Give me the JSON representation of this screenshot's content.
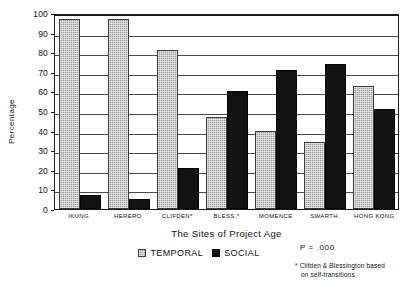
{
  "chart_data": {
    "type": "bar",
    "title": "",
    "xlabel": "The Sites of Project Age",
    "ylabel": "Percentage",
    "ylim": [
      0,
      100
    ],
    "ytick_step": 10,
    "grid": true,
    "legend_position": "bottom",
    "categories": [
      "IKUNG",
      "HERERO",
      "CLIFDEN*",
      "BLESS.*",
      "MOMENCE",
      "SWARTH.",
      "HONG KONG"
    ],
    "series": [
      {
        "name": "TEMPORAL",
        "color": "#9b9b9b",
        "values": [
          97,
          97,
          81,
          47,
          40,
          34,
          63
        ]
      },
      {
        "name": "SOCIAL",
        "color": "#121212",
        "values": [
          7,
          5,
          21,
          60,
          71,
          74,
          51
        ]
      }
    ],
    "yticks": [
      "100",
      "90",
      "80",
      "70",
      "60",
      "50",
      "40",
      "30",
      "20",
      "10",
      "0"
    ],
    "annotations": [
      {
        "name": "p-value",
        "text": "P = .000"
      },
      {
        "name": "asterisk-footnote",
        "line1": "* Clifden & Blessington based",
        "line2": "on self-transitions"
      }
    ]
  },
  "axis": {
    "y_title": "Percentage",
    "x_title": "The Sites of Project Age"
  },
  "legend": {
    "items": [
      {
        "label": "TEMPORAL"
      },
      {
        "label": "SOCIAL"
      }
    ]
  },
  "notes": {
    "p_value": "P = .000",
    "footnote_line1": "* Clifden & Blessington based",
    "footnote_line2": "on self-transitions"
  }
}
